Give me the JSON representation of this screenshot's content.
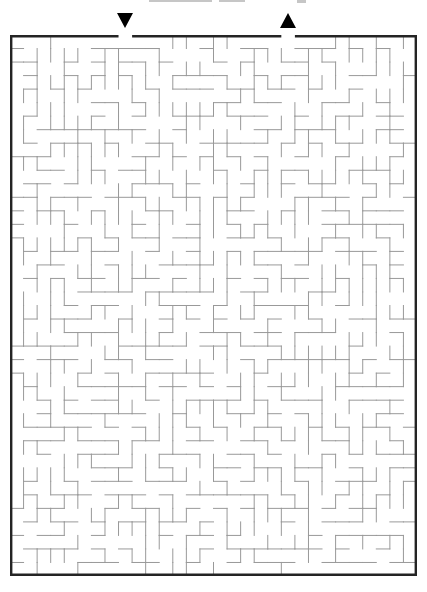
{
  "page": {
    "background_color": "#ffffff"
  },
  "maze": {
    "rows": 40,
    "cols": 30,
    "seed": 1371,
    "entrance": {
      "side": "top",
      "col": 8,
      "marker_glyph": "down-triangle"
    },
    "exit": {
      "side": "top",
      "col": 20,
      "marker_glyph": "up-triangle"
    },
    "colors": {
      "interior_wall": "#999999",
      "outer_border": "#242424",
      "marker": "#000000",
      "background": "#ffffff"
    }
  }
}
